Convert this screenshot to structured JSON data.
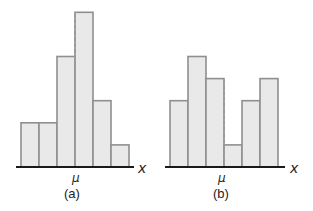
{
  "chart_data": [
    {
      "type": "bar",
      "title": "(a)",
      "xlabel": "x",
      "mean_label": "μ",
      "categories": [
        "1",
        "2",
        "3",
        "4",
        "5",
        "6"
      ],
      "values": [
        2,
        2,
        5,
        7,
        3,
        1
      ],
      "mean_position_bar_edge": 3,
      "grid": false,
      "legend": null
    },
    {
      "type": "bar",
      "title": "(b)",
      "xlabel": "x",
      "mean_label": "μ",
      "categories": [
        "1",
        "2",
        "3",
        "4",
        "5",
        "6"
      ],
      "values": [
        3,
        5,
        4,
        1,
        3,
        4
      ],
      "mean_position_bar_edge": 3,
      "grid": false,
      "legend": null
    }
  ],
  "panels": {
    "a": {
      "caption": "(a)",
      "axis_label": "x",
      "mean_label": "μ"
    },
    "b": {
      "caption": "(b)",
      "axis_label": "x",
      "mean_label": "μ"
    }
  },
  "colors": {
    "bar_fill": "#e9e9e9",
    "bar_stroke": "#8f8f8f",
    "axis": "#1a1a1a",
    "mean_line": "#9a9a9a"
  }
}
